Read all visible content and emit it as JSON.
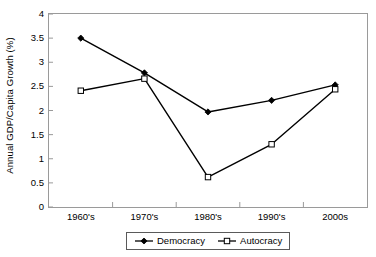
{
  "chart_data": {
    "type": "line",
    "title": "",
    "xlabel": "",
    "ylabel": "Annual GDP/Capita Growth (%)",
    "categories": [
      "1960's",
      "1970's",
      "1980's",
      "1990's",
      "2000s"
    ],
    "series": [
      {
        "name": "Democracy",
        "marker": "filled-diamond",
        "color": "#000000",
        "values": [
          3.5,
          2.78,
          1.97,
          2.21,
          2.53
        ]
      },
      {
        "name": "Autocracy",
        "marker": "open-square",
        "color": "#000000",
        "values": [
          2.41,
          2.66,
          0.62,
          1.3,
          2.44
        ]
      }
    ],
    "ylim": [
      0,
      4
    ],
    "yticks": [
      0,
      0.5,
      1,
      1.5,
      2,
      2.5,
      3,
      3.5,
      4
    ],
    "ytick_labels": [
      "0",
      "0.5",
      "1",
      "1.5",
      "2",
      "2.5",
      "3",
      "3.5",
      "4"
    ],
    "grid": false,
    "legend_position": "bottom"
  },
  "legend": {
    "entries": [
      {
        "label": "Democracy",
        "marker": "filled-diamond"
      },
      {
        "label": "Autocracy",
        "marker": "open-square"
      }
    ]
  },
  "colors": {
    "line": "#000000",
    "frame": "#9a9a9a",
    "legend_border": "#5a5a5a",
    "background": "#ffffff"
  }
}
